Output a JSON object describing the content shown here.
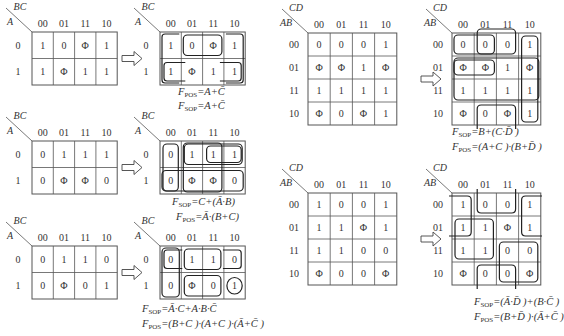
{
  "maps3": [
    {
      "id": "map-a",
      "row_var": "A",
      "col_var": "BC",
      "col_labels": [
        "00",
        "01",
        "11",
        "10"
      ],
      "row_labels": [
        "0",
        "1"
      ],
      "cells": [
        [
          "1",
          "0",
          "Φ",
          "1"
        ],
        [
          "1",
          "Φ",
          "1",
          "1"
        ]
      ],
      "loops": [
        {
          "r0": 0,
          "r1": 0,
          "c0": 1,
          "c1": 2,
          "wrap": false
        },
        {
          "r0": 0,
          "r1": 1,
          "c0": 0,
          "c1": 0,
          "wrap": "right-open"
        },
        {
          "r0": 0,
          "r1": 1,
          "c0": 3,
          "c1": 3,
          "wrap": "left-open"
        },
        {
          "r0": 1,
          "r1": 1,
          "c0": 0,
          "c1": 0,
          "wrap": false
        },
        {
          "r0": 1,
          "r1": 1,
          "c0": 3,
          "c1": 3,
          "wrap": false
        }
      ],
      "formulas": [
        {
          "name": "F",
          "sub": "POS",
          "expr": "=A+C̄"
        },
        {
          "name": "F",
          "sub": "SOP",
          "expr": "=A+C̄"
        }
      ]
    },
    {
      "id": "map-b",
      "row_var": "A",
      "col_var": "BC",
      "col_labels": [
        "00",
        "01",
        "11",
        "10"
      ],
      "row_labels": [
        "0",
        "1"
      ],
      "cells": [
        [
          "0",
          "1",
          "1",
          "1"
        ],
        [
          "0",
          "Φ",
          "Φ",
          "0"
        ]
      ],
      "formulas": [
        {
          "name": "F",
          "sub": "SOP",
          "expr": "=C+(Ā·B)"
        },
        {
          "name": "F",
          "sub": "POS",
          "expr": "=Ā·(B+C)"
        }
      ]
    },
    {
      "id": "map-c",
      "row_var": "A",
      "col_var": "BC",
      "col_labels": [
        "00",
        "01",
        "11",
        "10"
      ],
      "row_labels": [
        "0",
        "1"
      ],
      "cells": [
        [
          "0",
          "1",
          "1",
          "0"
        ],
        [
          "0",
          "Φ",
          "0",
          "1"
        ]
      ],
      "formulas": [
        {
          "name": "F",
          "sub": "SOP",
          "expr": "=Ā·C+A·B·C̄"
        },
        {
          "name": "F",
          "sub": "POS",
          "expr": "=(B+C )·(A+C )·(Ā+C̄ )"
        }
      ]
    }
  ],
  "maps4": [
    {
      "id": "map-d",
      "row_var": "AB",
      "col_var": "CD",
      "col_labels": [
        "00",
        "01",
        "11",
        "10"
      ],
      "row_labels": [
        "00",
        "01",
        "11",
        "10"
      ],
      "cells": [
        [
          "0",
          "0",
          "0",
          "1"
        ],
        [
          "Φ",
          "Φ",
          "1",
          "Φ"
        ],
        [
          "1",
          "1",
          "1",
          "1"
        ],
        [
          "Φ",
          "0",
          "Φ",
          "1"
        ]
      ],
      "formulas": [
        {
          "name": "F",
          "sub": "SOP",
          "expr": "=B+(C·D̄ )"
        },
        {
          "name": "F",
          "sub": "POS",
          "expr": "=(A+C )·(B+D̄ )"
        }
      ]
    },
    {
      "id": "map-e",
      "row_var": "AB",
      "col_var": "CD",
      "col_labels": [
        "00",
        "01",
        "11",
        "10"
      ],
      "row_labels": [
        "00",
        "01",
        "11",
        "10"
      ],
      "cells": [
        [
          "1",
          "0",
          "0",
          "1"
        ],
        [
          "1",
          "1",
          "Φ",
          "1"
        ],
        [
          "1",
          "1",
          "0",
          "0"
        ],
        [
          "Φ",
          "0",
          "0",
          "Φ"
        ]
      ],
      "formulas": [
        {
          "name": "F",
          "sub": "SOP",
          "expr": "=(Ā·D̄ )+(B·C̄ )"
        },
        {
          "name": "F",
          "sub": "POS",
          "expr": "=(B+D̄ )·(Ā+C̄ )"
        }
      ]
    }
  ],
  "arrow_icon": "hollow-right-arrow"
}
